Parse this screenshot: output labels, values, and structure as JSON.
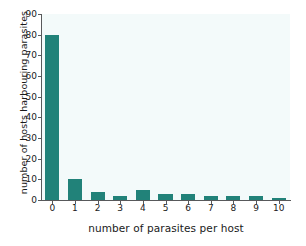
{
  "chart_data": {
    "type": "bar",
    "title": "",
    "xlabel": "number of parasites per host",
    "ylabel": "number of hosts harbouring parasites",
    "categories": [
      "0",
      "1",
      "2",
      "3",
      "4",
      "5",
      "6",
      "7",
      "8",
      "9",
      "10"
    ],
    "values": [
      80,
      10,
      4,
      2,
      5,
      3,
      3,
      2,
      2,
      2,
      1
    ],
    "ylim": [
      0,
      90
    ],
    "yticks": [
      "0",
      "10",
      "20",
      "30",
      "40",
      "50",
      "60",
      "70",
      "80",
      "90"
    ],
    "ytick_values": [
      0,
      10,
      20,
      30,
      40,
      50,
      60,
      70,
      80,
      90
    ],
    "xlim": [
      -0.5,
      10.5
    ],
    "grid": false,
    "legend": false,
    "legend_position": "none",
    "bar_color": "#218279",
    "plot_background": "#f3fafa",
    "axis_color": "#58595b",
    "text_color": "#1a1a1a"
  }
}
